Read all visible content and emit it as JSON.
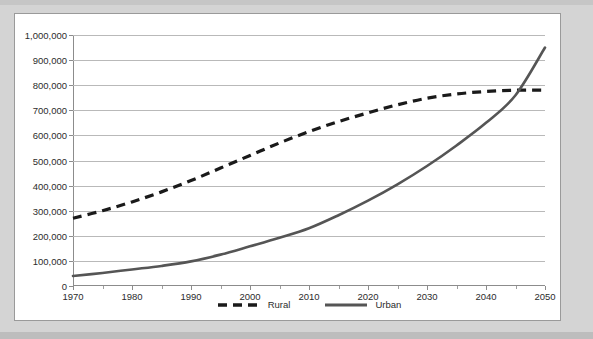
{
  "chart_data": {
    "type": "line",
    "title": "",
    "subtitle": "",
    "xlabel": "",
    "ylabel": "",
    "xlim": [
      1970,
      2050
    ],
    "ylim": [
      0,
      1000000
    ],
    "ytick_step": 100000,
    "xtick_step": 10,
    "xminor_step": 5,
    "grid": "horizontal",
    "legend_position": "bottom-center",
    "ytick_labels": [
      "0",
      "100,000",
      "200,000",
      "300,000",
      "400,000",
      "500,000",
      "600,000",
      "700,000",
      "800,000",
      "900,000",
      "1,000,000"
    ],
    "ytick_values": [
      0,
      100000,
      200000,
      300000,
      400000,
      500000,
      600000,
      700000,
      800000,
      900000,
      1000000
    ],
    "xtick_labels": [
      "1970",
      "1980",
      "1990",
      "2000",
      "2010",
      "2020",
      "2030",
      "2040",
      "2050"
    ],
    "xtick_values": [
      1970,
      1980,
      1990,
      2000,
      2010,
      2020,
      2030,
      2040,
      2050
    ],
    "xminor_values": [
      1975,
      1985,
      1995,
      2005,
      2015,
      2025,
      2035,
      2045
    ],
    "x": [
      1970,
      1975,
      1980,
      1985,
      1990,
      1995,
      2000,
      2005,
      2010,
      2015,
      2020,
      2025,
      2030,
      2035,
      2040,
      2045,
      2050
    ],
    "series": [
      {
        "name": "Rural",
        "style": "dashed",
        "color": "#1a1a1a",
        "values": [
          270000,
          300000,
          335000,
          375000,
          420000,
          470000,
          520000,
          570000,
          615000,
          655000,
          690000,
          722000,
          748000,
          765000,
          775000,
          780000,
          780000
        ]
      },
      {
        "name": "Urban",
        "style": "solid",
        "color": "#555555",
        "values": [
          40000,
          52000,
          66000,
          80000,
          98000,
          125000,
          158000,
          192000,
          230000,
          282000,
          340000,
          405000,
          478000,
          560000,
          650000,
          760000,
          950000
        ]
      }
    ],
    "legend": [
      {
        "label": "Rural",
        "style": "dashed",
        "color": "#1a1a1a"
      },
      {
        "label": "Urban",
        "style": "solid",
        "color": "#555555"
      }
    ],
    "annotations": {
      "crossover_year": 2043,
      "crossover_value": 785000
    }
  },
  "colors": {
    "mat": "#d4d4d4",
    "panel": "#ffffff",
    "panel_border": "#9a9a9a",
    "gridline": "#b9b9b9",
    "axis": "#8c8c8c",
    "rural": "#1a1a1a",
    "urban": "#555555"
  }
}
